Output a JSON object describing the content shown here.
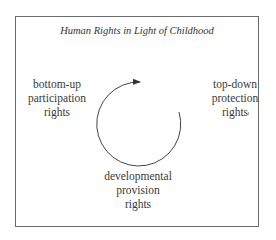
{
  "diagram": {
    "title": "Human Rights in Light of Childhood",
    "nodes": {
      "left": {
        "lines": [
          "bottom-up",
          "participation",
          "rights"
        ]
      },
      "right": {
        "lines": [
          "top-down",
          "protection",
          "rights"
        ]
      },
      "bottom": {
        "lines": [
          "developmental",
          "provision",
          "rights"
        ]
      }
    },
    "cycle": {
      "direction": "clockwise",
      "icon": "circular-arrow-icon"
    },
    "colors": {
      "border": "#6a6a6a",
      "text": "#3a3a3a",
      "arrow": "#333333"
    }
  }
}
